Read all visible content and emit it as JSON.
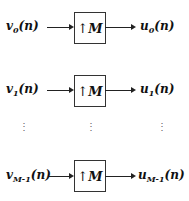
{
  "rows": [
    {
      "input": {
        "var": "v",
        "sub": "0",
        "arg": "(n)"
      },
      "block": {
        "op": "↑",
        "factor": "M"
      },
      "output": {
        "var": "u",
        "sub": "0",
        "arg": "(n)"
      }
    },
    {
      "input": {
        "var": "v",
        "sub": "1",
        "arg": "(n)"
      },
      "block": {
        "op": "↑",
        "factor": "M"
      },
      "output": {
        "var": "u",
        "sub": "1",
        "arg": "(n)"
      }
    },
    {
      "input": {
        "var": "v",
        "sub": "M-1",
        "arg": "(n)"
      },
      "block": {
        "op": "↑",
        "factor": "M"
      },
      "output": {
        "var": "u",
        "sub": "M-1",
        "arg": "(n)"
      }
    }
  ],
  "ellipsis": "⋮"
}
